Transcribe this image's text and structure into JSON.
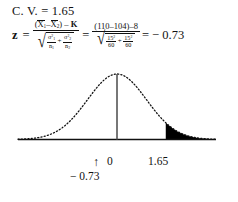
{
  "critical_value_line": {
    "label": "C. V. = 1.65"
  },
  "z_equation": {
    "variable": "z",
    "equals": "=",
    "symbolic": {
      "numerator": {
        "x1": "X",
        "x1_sub": "1",
        "minus": "–",
        "x2": "X",
        "x2_sub": "2",
        "minus2": "–",
        "k": "K"
      },
      "denominator": {
        "radical": "√",
        "term1_num": "σ",
        "term1_num_sup": "2",
        "term1_num_sub": "1",
        "term1_den": "n",
        "term1_den_sub": "1",
        "plus": "+",
        "term2_num": "σ",
        "term2_num_sup": "2",
        "term2_num_sub": "2",
        "term2_den": "n",
        "term2_den_sub": "2"
      }
    },
    "numeric": {
      "numerator": "(110–104)–8",
      "denominator": {
        "radical": "√",
        "term1_num": "15",
        "term1_num_sup": "2",
        "term1_den": "60",
        "plus": "+",
        "term2_num": "15",
        "term2_num_sup": "2",
        "term2_den": "60"
      }
    },
    "result": "=  − 0.73"
  },
  "chart_data": {
    "type": "line",
    "title": "",
    "xlabel": "",
    "ylabel": "",
    "curve": "standard normal density",
    "xlim": [
      -3.35,
      3.35
    ],
    "grid": false,
    "legend": null,
    "center_line_x": 0,
    "shaded_region": {
      "from": 1.65,
      "to": 3.35,
      "fill": "#000000",
      "label": "rejection region"
    },
    "markers": [
      {
        "label": "↑",
        "x": -0.73,
        "type": "arrow"
      },
      {
        "label": "0",
        "x": 0,
        "type": "tick-label"
      },
      {
        "label": "1.65",
        "x": 1.65,
        "type": "tick-label"
      },
      {
        "label": "− 0.73",
        "x": -0.73,
        "type": "value-label"
      }
    ],
    "curve_style": "dotted",
    "baseline_color": "#111111"
  },
  "axis_labels": {
    "arrow": "↑",
    "zero": "0",
    "critical": "1.65",
    "test_statistic": "− 0.73"
  },
  "colors": {
    "ink": "#111111",
    "shade": "#000000",
    "background": "#ffffff"
  }
}
